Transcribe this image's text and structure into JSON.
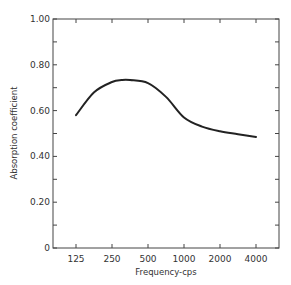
{
  "chart_data": {
    "type": "line",
    "title": "",
    "xlabel": "Frequency-cps",
    "ylabel": "Absorption coefficient",
    "x_scale": "log2",
    "x": [
      125,
      250,
      500,
      1000,
      2000,
      4000
    ],
    "categories": [
      "125",
      "250",
      "500",
      "1000",
      "2000",
      "4000"
    ],
    "series": [
      {
        "name": "Absorption coefficient",
        "values": [
          0.58,
          0.725,
          0.72,
          0.57,
          0.51,
          0.485
        ]
      }
    ],
    "curve_points": [
      [
        125,
        0.58
      ],
      [
        177,
        0.68
      ],
      [
        250,
        0.725
      ],
      [
        300,
        0.733
      ],
      [
        354,
        0.733
      ],
      [
        500,
        0.72
      ],
      [
        707,
        0.66
      ],
      [
        1000,
        0.57
      ],
      [
        1414,
        0.53
      ],
      [
        2000,
        0.51
      ],
      [
        2828,
        0.497
      ],
      [
        4000,
        0.485
      ]
    ],
    "ylim": [
      0,
      1.0
    ],
    "yticks": [
      0,
      0.2,
      0.4,
      0.6,
      0.8,
      1.0
    ],
    "ytick_labels": [
      "0",
      "0.20",
      "0.40",
      "0.60",
      "0.80",
      "1.00"
    ],
    "yminor_ticks": [
      0.1,
      0.3,
      0.5,
      0.7,
      0.9
    ],
    "grid": false,
    "legend": null,
    "color": "#222222"
  }
}
